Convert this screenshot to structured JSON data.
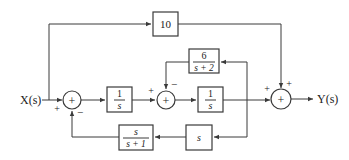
{
  "diagram": {
    "type": "block-diagram",
    "input_label": "X(s)",
    "output_label": "Y(s)",
    "blocks": {
      "gain_10": {
        "text": "10"
      },
      "integrator_1": {
        "num": "1",
        "den": "s"
      },
      "integrator_2": {
        "num": "1",
        "den": "s"
      },
      "feedback_6": {
        "num": "6",
        "den": "s + 2"
      },
      "derivative": {
        "text": "s"
      },
      "feedback_s_s1": {
        "num": "s",
        "den": "s + 1"
      }
    },
    "summers": {
      "sum1": {
        "sign_left": "+",
        "sign_bottom": "−",
        "symbol": "+"
      },
      "sum2": {
        "sign_left": "+",
        "sign_top": "−",
        "symbol": "+"
      },
      "sum3": {
        "sign_left": "+",
        "sign_top": "+",
        "symbol": "+"
      }
    }
  }
}
